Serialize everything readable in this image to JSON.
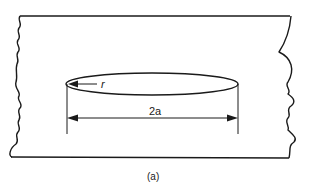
{
  "figure": {
    "caption": "(a)",
    "type": "plate with elliptical crack",
    "labels": {
      "tip_radius": "r",
      "crack_length": "2a"
    },
    "colors": {
      "line": "#1a1a1a",
      "background": "#ffffff"
    }
  }
}
